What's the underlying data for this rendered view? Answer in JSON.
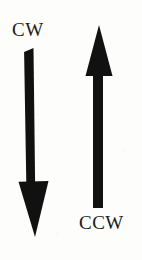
{
  "figure": {
    "background_color": "#fdfdfc",
    "ink_color": "#111111",
    "width": 142,
    "height": 260
  },
  "labels": {
    "cw": "CW",
    "ccw": "CCW"
  },
  "arrows": [
    {
      "id": "cw-arrow",
      "label": "CW",
      "direction": "down",
      "color": "#111111",
      "tip": {
        "x": 35,
        "y": 237
      },
      "tail": {
        "x": 29,
        "y": 48
      },
      "shaft_width": 9,
      "head_width": 31,
      "head_length": 56
    },
    {
      "id": "ccw-arrow",
      "label": "CCW",
      "direction": "up",
      "color": "#111111",
      "tip": {
        "x": 99,
        "y": 25
      },
      "tail": {
        "x": 98,
        "y": 208
      },
      "shaft_width": 10,
      "head_width": 27,
      "head_length": 51
    }
  ]
}
